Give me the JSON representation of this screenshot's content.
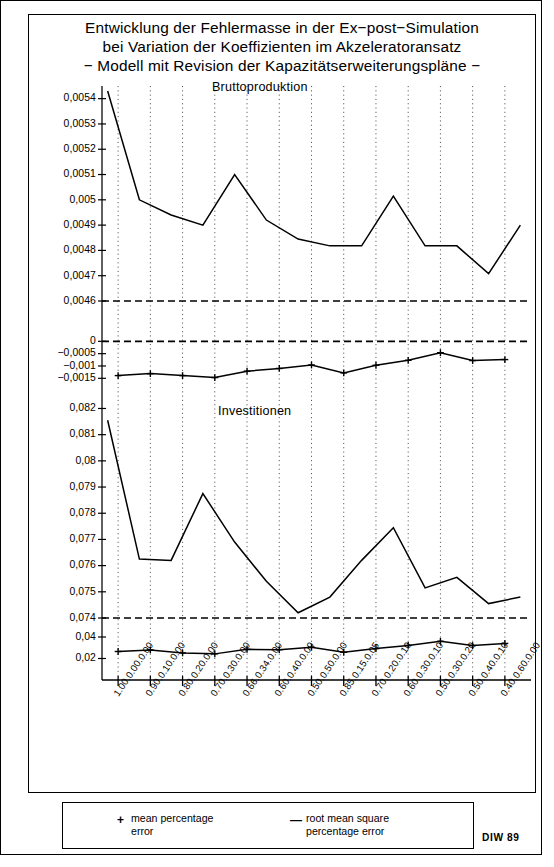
{
  "title": {
    "line1": "Entwicklung der Fehlermasse in der Ex−post−Simulation",
    "line2": "bei Variation der Koeffizienten im Akzeleratoransatz",
    "line3": "− Modell mit Revision der Kapazitätserweiterungspläne −"
  },
  "source_mark": "DIW 89",
  "legend": {
    "items": [
      {
        "symbol": "+",
        "line1": "mean percentage",
        "line2": "error"
      },
      {
        "symbol": "—",
        "line1": "root mean square",
        "line2": "percentage error"
      }
    ]
  },
  "panel_captions": {
    "top": "Bruttoproduktion",
    "middle": "Investitionen"
  },
  "colors": {
    "ink": "#000000",
    "background": "#ffffff",
    "gridline": "#555555"
  },
  "chart_data": {
    "type": "line",
    "title": "Entwicklung der Fehlermasse in der Ex−post−Simulation bei Variation der Koeffizienten im Akzeleratoransatz − Modell mit Revision der Kapazitätserweiterungspläne −",
    "xlabel": "",
    "grid": true,
    "legend_position": "bottom",
    "categories": [
      "1.00.0.00.0.00",
      "0.90.0.10.0.00",
      "0.80.0.20.0.00",
      "0.70.0.30.0.00",
      "0.66.0.34.0.00",
      "0.60.0.40.0.00",
      "0.50.0.50.0.00",
      "0.85.0.15.0.05",
      "0.70.0.20.0.10",
      "0.60.0.30.0.10",
      "0.50.0.30.0.20",
      "0.50.0.40.0.10",
      "0.40.0.60.0.00"
    ],
    "panels": [
      {
        "name": "bruttoproduktion-rmse",
        "caption": "Bruttoproduktion",
        "series_name": "root mean square percentage error",
        "marker": "none",
        "ylabel": "",
        "ylim": [
          0.0046,
          0.00545
        ],
        "yticks": [
          0.0046,
          0.0047,
          0.0048,
          0.0049,
          0.005,
          0.0051,
          0.0052,
          0.0053,
          0.0054
        ],
        "ytick_labels": [
          "0,0046",
          "0,0047",
          "0,0048",
          "0,0049",
          "0,005",
          "0,0051",
          "0,0052",
          "0,0053",
          "0,0054"
        ],
        "values": [
          0.00543,
          0.005,
          0.00494,
          0.0049,
          0.0051,
          0.00492,
          0.004845,
          0.004818,
          0.004818,
          0.005015,
          0.004818,
          0.004818,
          0.004755,
          0.004708,
          0.0049
        ],
        "values_used": [
          0.00543,
          0.005,
          0.00494,
          0.0049,
          0.0051,
          0.00492,
          0.004845,
          0.004818,
          0.004818,
          0.005015,
          0.004818,
          0.004818,
          0.004708,
          0.0049
        ]
      },
      {
        "name": "bruttoproduktion-mpe",
        "caption": "",
        "series_name": "mean percentage error",
        "marker": "plus",
        "ylabel": "",
        "ylim": [
          -0.00165,
          0.00046
        ],
        "yticks": [
          -0.0015,
          -0.001,
          -0.0005,
          0
        ],
        "ytick_labels": [
          "−0,0015",
          "−0,001",
          "−0,0005",
          "0"
        ],
        "dashed_lines": [
          0.0046,
          0
        ],
        "values": [
          -0.00139,
          -0.00131,
          -0.00139,
          -0.00147,
          -0.00121,
          -0.0011,
          -0.00096,
          -0.00128,
          -0.00097,
          -0.00077,
          -0.00046,
          -0.00078,
          -0.00074
        ]
      },
      {
        "name": "investitionen-rmse",
        "caption": "Investitionen",
        "series_name": "root mean square percentage error",
        "marker": "none",
        "ylabel": "",
        "ylim": [
          0.074,
          0.0824
        ],
        "yticks": [
          0.074,
          0.075,
          0.076,
          0.077,
          0.078,
          0.079,
          0.08,
          0.081,
          0.082
        ],
        "ytick_labels": [
          "0,074",
          "0,075",
          "0,076",
          "0,077",
          "0,078",
          "0,079",
          "0,08",
          "0,081",
          "0,082"
        ],
        "values": [
          0.08155,
          0.07625,
          0.0762,
          0.07875,
          0.0769,
          0.0754,
          0.0742,
          0.0748,
          0.0762,
          0.07745,
          0.07515,
          0.07555,
          0.07455,
          0.0748
        ]
      },
      {
        "name": "investitionen-mpe",
        "caption": "",
        "series_name": "mean percentage error",
        "marker": "plus",
        "ylabel": "",
        "ylim": [
          0.0,
          0.0465
        ],
        "yticks": [
          0.02,
          0.04
        ],
        "ytick_labels": [
          "0,02",
          "0,04"
        ],
        "dashed_lines": [
          0.074
        ],
        "values": [
          0.0265,
          0.028,
          0.0252,
          0.0243,
          0.0285,
          0.0282,
          0.0305,
          0.0258,
          0.0292,
          0.0322,
          0.036,
          0.032,
          0.034
        ]
      }
    ]
  }
}
